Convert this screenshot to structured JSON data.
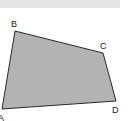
{
  "diagram": {
    "type": "quadrilateral",
    "fill_color": "#b3b3b3",
    "stroke_color": "#2a2a2a",
    "band_color": "#e6e6e6",
    "vertices": [
      {
        "label": "A",
        "x": 2,
        "y": 109
      },
      {
        "label": "B",
        "x": 15,
        "y": 31
      },
      {
        "label": "C",
        "x": 103,
        "y": 53
      },
      {
        "label": "D",
        "x": 116,
        "y": 101
      }
    ],
    "labels": {
      "a": "A",
      "b": "B",
      "c": "C",
      "d": "D"
    }
  }
}
